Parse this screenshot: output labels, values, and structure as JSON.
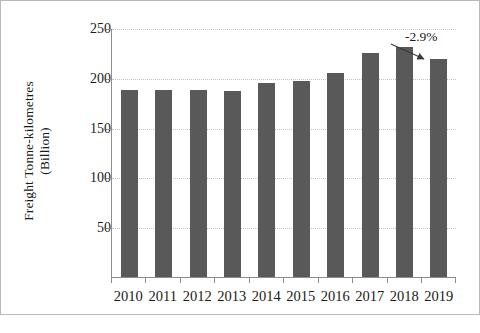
{
  "chart_data": {
    "type": "bar",
    "title": "",
    "subtitle": "",
    "xlabel": "",
    "ylabel_line1": "Freight Tonne-kilometres",
    "ylabel_line2": "(Billion)",
    "categories": [
      "2010",
      "2011",
      "2012",
      "2013",
      "2014",
      "2015",
      "2016",
      "2017",
      "2018",
      "2019"
    ],
    "values": [
      188,
      188,
      188,
      187,
      195,
      197,
      205,
      225,
      231,
      219
    ],
    "series": [
      {
        "name": "Freight Tonne-kilometres (Billion)",
        "values": [
          188,
          188,
          188,
          187,
          195,
          197,
          205,
          225,
          231,
          219
        ]
      }
    ],
    "ylim": [
      0,
      250
    ],
    "yticks": [
      0,
      50,
      100,
      150,
      200,
      250
    ],
    "ytick_labels": [
      "",
      "50",
      "100",
      "150",
      "200",
      "250"
    ],
    "grid": true,
    "grid_axis": "y",
    "legend": false,
    "legend_position": "none",
    "bar_color": "#595959",
    "gridline_color": "#c3c3c3",
    "axis_color": "#8d8d8d",
    "background_color": "#ffffff",
    "border_color": "#b9b9b9",
    "annotations": [
      {
        "text": "-2.9%",
        "points_to_category": "2019",
        "type": "arrow-label"
      }
    ]
  },
  "footer": {
    "watermark": ""
  }
}
